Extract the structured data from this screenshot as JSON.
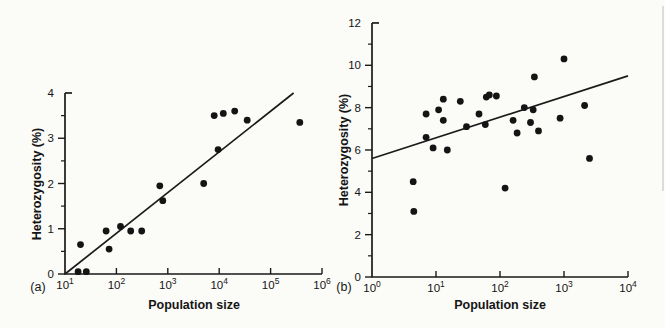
{
  "figure": {
    "ink_color": "#1a1a1a",
    "dot_color": "#141414",
    "paper_color": "#fbfbf8"
  },
  "chart_data": [
    {
      "type": "scatter",
      "panel_label": "(a)",
      "xlabel": "Population size",
      "ylabel": "Heterozygosity (%)",
      "x_scale": "log10",
      "xlim": [
        10,
        1000000
      ],
      "ylim": [
        0,
        4
      ],
      "x_tick_exponents": [
        1,
        2,
        3,
        4,
        5,
        6
      ],
      "x_tick_labels": [
        "10^1",
        "10^2",
        "10^3",
        "10^4",
        "10^5",
        "10^6"
      ],
      "y_ticks": [
        0,
        1,
        2,
        3,
        4
      ],
      "y_minor_step": 0.5,
      "grid": false,
      "legend": null,
      "marker": "filled-circle",
      "points": [
        [
          18,
          0.05
        ],
        [
          26,
          0.05
        ],
        [
          20,
          0.65
        ],
        [
          63,
          0.95
        ],
        [
          72,
          0.55
        ],
        [
          120,
          1.05
        ],
        [
          190,
          0.95
        ],
        [
          310,
          0.95
        ],
        [
          700,
          1.95
        ],
        [
          800,
          1.62
        ],
        [
          5000,
          2.0
        ],
        [
          9500,
          2.75
        ],
        [
          8000,
          3.5
        ],
        [
          12000,
          3.55
        ],
        [
          20000,
          3.6
        ],
        [
          35000,
          3.4
        ],
        [
          370000,
          3.35
        ]
      ],
      "trend_line": {
        "x1": 10,
        "y1": 0.0,
        "x2": 280000,
        "y2": 4.0
      }
    },
    {
      "type": "scatter",
      "panel_label": "(b)",
      "xlabel": "Population size",
      "ylabel": "Heterozygosity (%)",
      "x_scale": "log10",
      "xlim": [
        1,
        10000
      ],
      "ylim": [
        0,
        12
      ],
      "x_tick_exponents": [
        0,
        1,
        2,
        3,
        4
      ],
      "x_tick_labels": [
        "10^0",
        "10^1",
        "10^2",
        "10^3",
        "10^4"
      ],
      "y_ticks": [
        0,
        2,
        4,
        6,
        8,
        10,
        12
      ],
      "y_minor_step": 1,
      "grid": false,
      "legend": null,
      "marker": "filled-circle",
      "points": [
        [
          4.4,
          4.5
        ],
        [
          4.5,
          3.1
        ],
        [
          7,
          7.7
        ],
        [
          7,
          6.6
        ],
        [
          9,
          6.1
        ],
        [
          11,
          7.9
        ],
        [
          13,
          8.4
        ],
        [
          13,
          7.4
        ],
        [
          15,
          6.0
        ],
        [
          24,
          8.3
        ],
        [
          30,
          7.1
        ],
        [
          47,
          7.7
        ],
        [
          59,
          7.2
        ],
        [
          61,
          8.5
        ],
        [
          68,
          8.6
        ],
        [
          88,
          8.55
        ],
        [
          120,
          4.2
        ],
        [
          160,
          7.4
        ],
        [
          185,
          6.8
        ],
        [
          240,
          8.0
        ],
        [
          300,
          7.3
        ],
        [
          330,
          7.9
        ],
        [
          345,
          9.45
        ],
        [
          400,
          6.9
        ],
        [
          870,
          7.5
        ],
        [
          1000,
          10.3
        ],
        [
          2100,
          8.1
        ],
        [
          2500,
          5.6
        ]
      ],
      "trend_line": {
        "x1": 1,
        "y1": 5.6,
        "x2": 10000,
        "y2": 9.5
      }
    }
  ]
}
